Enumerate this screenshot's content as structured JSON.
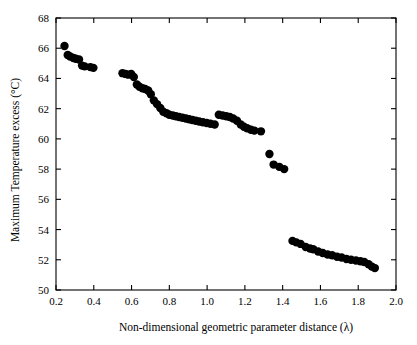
{
  "chart_data": {
    "type": "scatter",
    "title": "",
    "xlabel": "Non-dimensional geometric parameter distance (λ)",
    "ylabel": "Maximum Temperature excess (°C)",
    "xlim": [
      0.2,
      2.0
    ],
    "ylim": [
      50,
      68
    ],
    "xticks": [
      "0.2",
      "0.4",
      "0.6",
      "0.8",
      "1.0",
      "1.2",
      "1.4",
      "1.6",
      "1.8",
      "2.0"
    ],
    "xtick_values": [
      0.2,
      0.4,
      0.6,
      0.8,
      1.0,
      1.2,
      1.4,
      1.6,
      1.8,
      2.0
    ],
    "yticks": [
      "50",
      "52",
      "54",
      "56",
      "58",
      "60",
      "62",
      "64",
      "66",
      "68"
    ],
    "ytick_values": [
      50,
      52,
      54,
      56,
      58,
      60,
      62,
      64,
      66,
      68
    ],
    "grid": false,
    "legend": false,
    "marker": "filled-circle",
    "marker_color": "#000000",
    "marker_size": 4.2,
    "series": [
      {
        "name": "Maximum temperature excess",
        "points": [
          [
            0.245,
            66.15
          ],
          [
            0.262,
            65.55
          ],
          [
            0.275,
            65.45
          ],
          [
            0.292,
            65.35
          ],
          [
            0.305,
            65.3
          ],
          [
            0.322,
            65.25
          ],
          [
            0.338,
            64.85
          ],
          [
            0.352,
            64.8
          ],
          [
            0.382,
            64.75
          ],
          [
            0.398,
            64.7
          ],
          [
            0.552,
            64.35
          ],
          [
            0.568,
            64.3
          ],
          [
            0.582,
            64.25
          ],
          [
            0.598,
            64.3
          ],
          [
            0.612,
            64.1
          ],
          [
            0.628,
            63.6
          ],
          [
            0.642,
            63.45
          ],
          [
            0.658,
            63.35
          ],
          [
            0.672,
            63.3
          ],
          [
            0.688,
            63.2
          ],
          [
            0.702,
            62.95
          ],
          [
            0.718,
            62.55
          ],
          [
            0.735,
            62.3
          ],
          [
            0.752,
            62.05
          ],
          [
            0.768,
            61.8
          ],
          [
            0.785,
            61.7
          ],
          [
            0.8,
            61.6
          ],
          [
            0.818,
            61.55
          ],
          [
            0.835,
            61.5
          ],
          [
            0.852,
            61.45
          ],
          [
            0.87,
            61.4
          ],
          [
            0.888,
            61.35
          ],
          [
            0.905,
            61.3
          ],
          [
            0.922,
            61.25
          ],
          [
            0.94,
            61.2
          ],
          [
            0.958,
            61.15
          ],
          [
            0.978,
            61.1
          ],
          [
            0.998,
            61.05
          ],
          [
            1.018,
            61.0
          ],
          [
            1.04,
            60.95
          ],
          [
            1.062,
            61.6
          ],
          [
            1.082,
            61.55
          ],
          [
            1.102,
            61.5
          ],
          [
            1.12,
            61.45
          ],
          [
            1.138,
            61.35
          ],
          [
            1.158,
            61.2
          ],
          [
            1.178,
            60.95
          ],
          [
            1.195,
            60.8
          ],
          [
            1.212,
            60.7
          ],
          [
            1.232,
            60.6
          ],
          [
            1.25,
            60.55
          ],
          [
            1.285,
            60.5
          ],
          [
            1.33,
            59.0
          ],
          [
            1.352,
            58.3
          ],
          [
            1.382,
            58.15
          ],
          [
            1.408,
            58.0
          ],
          [
            1.452,
            53.25
          ],
          [
            1.472,
            53.15
          ],
          [
            1.495,
            53.05
          ],
          [
            1.522,
            52.85
          ],
          [
            1.545,
            52.75
          ],
          [
            1.562,
            52.7
          ],
          [
            1.588,
            52.55
          ],
          [
            1.612,
            52.45
          ],
          [
            1.638,
            52.35
          ],
          [
            1.662,
            52.3
          ],
          [
            1.688,
            52.2
          ],
          [
            1.712,
            52.15
          ],
          [
            1.738,
            52.05
          ],
          [
            1.762,
            52.0
          ],
          [
            1.788,
            51.95
          ],
          [
            1.812,
            51.9
          ],
          [
            1.832,
            51.85
          ],
          [
            1.855,
            51.7
          ],
          [
            1.872,
            51.55
          ],
          [
            1.888,
            51.45
          ]
        ]
      }
    ]
  }
}
